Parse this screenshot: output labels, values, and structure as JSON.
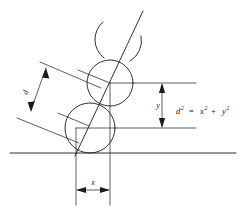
{
  "figure": {
    "equation": {
      "lhs_base": "d",
      "lhs_exp": "2",
      "equals": "=",
      "term1_base": "x",
      "term1_exp": "2",
      "plus": "+",
      "term2_base": "y",
      "term2_exp": "2",
      "plain": "d2 = x2 + y2"
    },
    "labels": {
      "d": "d",
      "y": "y",
      "x": "x"
    },
    "colors": {
      "ink": "#1a1a1a",
      "background": "#ffffff"
    }
  },
  "geometry": {
    "circles": [
      {
        "name": "top-partial-circle",
        "cx": 118,
        "cy": 42,
        "r": 23,
        "partial": true
      },
      {
        "name": "middle-circle",
        "cx": 110,
        "cy": 83,
        "r": 23,
        "partial": false
      },
      {
        "name": "bottom-circle",
        "cx": 90,
        "cy": 128,
        "r": 25,
        "partial": false
      }
    ],
    "center_line": {
      "x1": 141,
      "y1": 12,
      "x2": 76,
      "y2": 153
    },
    "baseline": {
      "x1": 10,
      "y1": 153,
      "x2": 236,
      "y2": 153
    },
    "upper_horizontal": {
      "x1": 110,
      "y1": 83,
      "x2": 196,
      "y2": 83
    },
    "lower_horizontal": {
      "x1": 76,
      "y1": 128,
      "x2": 196,
      "y2": 128
    },
    "dimensions": {
      "d": {
        "label": "d",
        "orientation": "diagonal"
      },
      "y": {
        "label": "y",
        "orientation": "vertical",
        "from": 83,
        "to": 128,
        "axis_x": 162
      },
      "x": {
        "label": "x",
        "orientation": "horizontal",
        "from": 76,
        "to": 110,
        "axis_y": 190
      }
    }
  }
}
